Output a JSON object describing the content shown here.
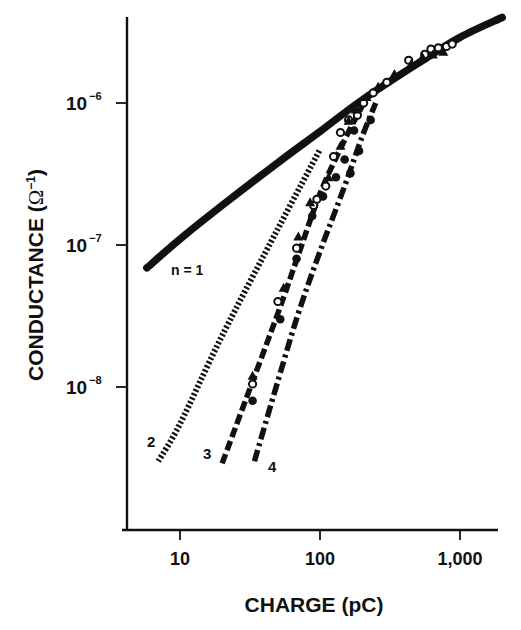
{
  "chart_data": {
    "type": "line",
    "title": "",
    "xlabel": "CHARGE (pC)",
    "ylabel": "CONDUCTANCE (Ω⁻¹)",
    "xscale": "log",
    "yscale": "log",
    "xlim": [
      4,
      2000
    ],
    "ylim": [
      8e-10,
      5e-06
    ],
    "x_ticks": [
      10,
      100,
      1000
    ],
    "x_tick_labels": [
      "10",
      "100",
      "1,000"
    ],
    "y_ticks": [
      1e-08,
      1e-07,
      1e-06
    ],
    "y_tick_labels": [
      {
        "base": "10",
        "exp": "−8"
      },
      {
        "base": "10",
        "exp": "−7"
      },
      {
        "base": "10",
        "exp": "−6"
      }
    ],
    "grid": false,
    "legend": "none (curves labeled inline)",
    "series": [
      {
        "name": "n = 1",
        "label": "n = 1",
        "style": "solid",
        "x": [
          5.8,
          10,
          20,
          50,
          100,
          200,
          500,
          1000,
          2000
        ],
        "y": [
          6.9e-08,
          1.1e-07,
          1.9e-07,
          3.8e-07,
          6.3e-07,
          1.05e-06,
          1.9e-06,
          2.9e-06,
          4e-06
        ]
      },
      {
        "name": "n = 2",
        "label": "2",
        "style": "dotted",
        "x": [
          7,
          10,
          20,
          50,
          100
        ],
        "y": [
          3e-09,
          5.5e-09,
          2.3e-08,
          1.3e-07,
          4.7e-07
        ]
      },
      {
        "name": "n = 3",
        "label": "3",
        "style": "dashed",
        "x": [
          20,
          30,
          50,
          70,
          100,
          150,
          200
        ],
        "y": [
          2.9e-09,
          8.5e-09,
          3.3e-08,
          8.5e-08,
          2.3e-07,
          5.5e-07,
          9.5e-07
        ]
      },
      {
        "name": "n = 4",
        "label": "4",
        "style": "dash-dot",
        "x": [
          34,
          50,
          70,
          100,
          150,
          200,
          250
        ],
        "y": [
          3e-09,
          1.1e-08,
          3.3e-08,
          9e-08,
          2.6e-07,
          5.8e-07,
          1e-06
        ]
      }
    ],
    "scatter_markers": [
      {
        "shape": "open-circle",
        "x": [
          33,
          50,
          68,
          90,
          95,
          110,
          125,
          140,
          160,
          185,
          205,
          240,
          300,
          430,
          560,
          620,
          700,
          800,
          880
        ],
        "y": [
          1.05e-08,
          4e-08,
          9.5e-08,
          1.9e-07,
          2.1e-07,
          2.6e-07,
          4.2e-07,
          6.2e-07,
          7.6e-07,
          8.2e-07,
          1e-06,
          1.18e-06,
          1.4e-06,
          2e-06,
          2.2e-06,
          2.4e-06,
          2.45e-06,
          2.5e-06,
          2.6e-06
        ]
      },
      {
        "shape": "filled-circle",
        "x": [
          33,
          52,
          68,
          88,
          105,
          130,
          150,
          165,
          175,
          190,
          230
        ],
        "y": [
          8e-09,
          3e-08,
          8e-08,
          1.6e-07,
          2.2e-07,
          3e-07,
          4e-07,
          3.2e-07,
          6.4e-07,
          4.6e-07,
          7.6e-07
        ]
      },
      {
        "shape": "filled-triangle",
        "x": [
          33,
          55,
          70,
          85,
          115,
          140,
          160,
          180,
          215,
          260,
          340,
          450,
          540,
          640,
          760
        ],
        "y": [
          1.2e-08,
          5e-08,
          1.15e-07,
          2e-07,
          3e-07,
          5e-07,
          7.5e-07,
          9e-07,
          1.1e-06,
          1.3e-06,
          1.6e-06,
          1.9e-06,
          2.1e-06,
          2.2e-06,
          2.3e-06
        ]
      }
    ]
  },
  "labels": {
    "x_axis_title": "CHARGE (pC)",
    "y_axis_title_main": "CONDUCTANCE (",
    "y_axis_title_omega": "Ω",
    "y_axis_title_sup": "−1",
    "y_axis_title_close": ")",
    "curve_n1": "n = 1",
    "curve_2": "2",
    "curve_3": "3",
    "curve_4": "4"
  }
}
